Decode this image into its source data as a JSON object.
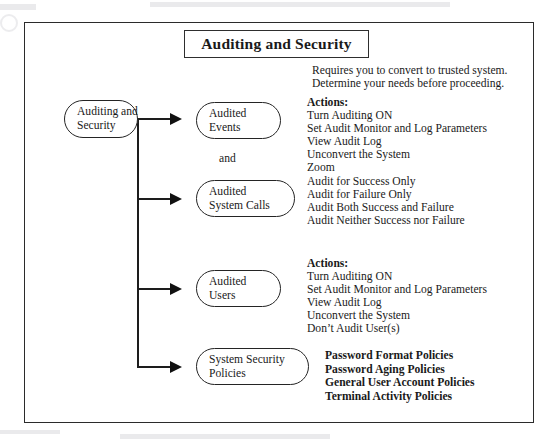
{
  "title": {
    "text": "Auditing and Security"
  },
  "nodes": [
    {
      "name": "source",
      "lines": [
        "Auditing and",
        "Security"
      ]
    },
    {
      "name": "audited-events",
      "lines": [
        "Audited",
        "Events"
      ]
    },
    {
      "name": "audited-system-calls",
      "lines": [
        "Audited",
        "System Calls"
      ]
    },
    {
      "name": "audited-users",
      "lines": [
        "Audited",
        "Users"
      ]
    },
    {
      "name": "system-security-policies",
      "lines": [
        "System Security",
        "Policies"
      ]
    }
  ],
  "connector_label": "and",
  "intro": {
    "line1": "Requires you to convert to trusted system.",
    "line2": "Determine your needs before proceeding."
  },
  "actions_events": {
    "heading": "Actions:",
    "items": [
      "Turn Auditing ON",
      "Set Audit Monitor and Log Parameters",
      "View Audit Log",
      "Unconvert the System",
      "Zoom",
      "Audit for Success Only",
      "Audit for Failure Only",
      "Audit Both Success and Failure",
      "Audit Neither Success nor Failure"
    ]
  },
  "actions_users": {
    "heading": "Actions:",
    "items": [
      "Turn Auditing ON",
      "Set Audit Monitor and Log Parameters",
      "View Audit Log",
      "Unconvert the System",
      "Don’t Audit User(s)"
    ]
  },
  "policies": {
    "items": [
      "Password Format Policies",
      "Password Aging Policies",
      "General User Account Policies",
      "Terminal Activity Policies"
    ]
  },
  "colors": {
    "ink": "#1a1a1a",
    "frame": "#2b2b2b",
    "connector": "#1d1d1d"
  }
}
